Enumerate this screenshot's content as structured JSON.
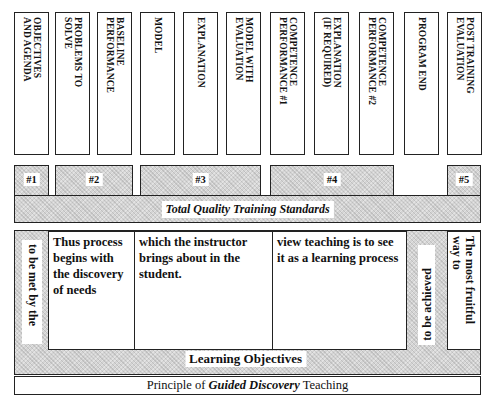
{
  "columns": [
    {
      "label": "OBJECTIVES\nAND AGENDA"
    },
    {
      "label": "PROBLEMS TO\nSOLVE"
    },
    {
      "label": "BASELINE\nPERFORMANCE"
    },
    {
      "label": "MODEL"
    },
    {
      "label": "EXPLANATION"
    },
    {
      "label": "MODEL WITH\nEVALUATION"
    },
    {
      "label": "COMPETENCE\nPERFORMANCE #1"
    },
    {
      "label": "EXPLANATION\n(IF REQUIRED)"
    },
    {
      "label": "COMPETENCE\nPERFORMANCE #2"
    },
    {
      "label": "PROGRAM END"
    },
    {
      "label": "POST TRAINING\nEVALUATION"
    }
  ],
  "phases": [
    {
      "label": "#1"
    },
    {
      "label": "#2"
    },
    {
      "label": "#3"
    },
    {
      "label": "#4"
    },
    {
      "label": "#5"
    }
  ],
  "standards_band": {
    "label": "Total Quality Training Standards"
  },
  "lower": {
    "left_vertical": "to be met by the",
    "cells": [
      {
        "text": "Thus process begins with the discovery of needs"
      },
      {
        "text": "which the instructor brings about in the student."
      },
      {
        "text": "view teaching is to see it as a learning process"
      }
    ],
    "right_vertical_gray": "to be achieved",
    "right_vertical_box": "The most fruitful way to"
  },
  "learning_band": {
    "label": "Learning Objectives"
  },
  "principle": {
    "prefix": "Principle of ",
    "emphasis": "Guided Discovery",
    "suffix": " Teaching"
  },
  "colors": {
    "border": "#222222",
    "hatch": "#d4d4d4",
    "background": "#ffffff"
  }
}
